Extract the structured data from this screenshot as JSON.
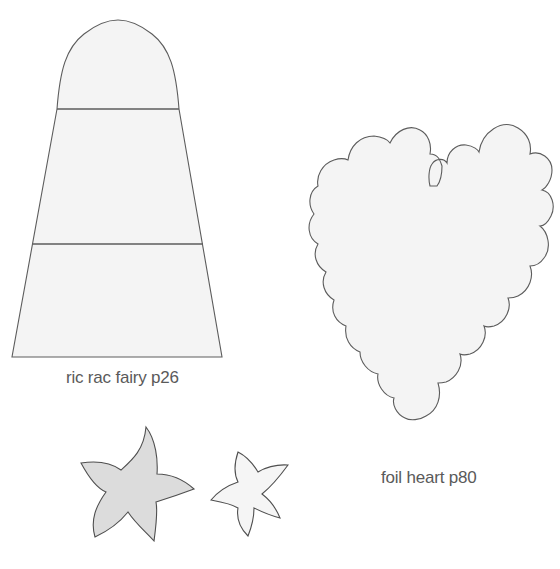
{
  "page": {
    "background": "#ffffff",
    "outline_color": "#5c5c5c",
    "fill_light": "#f4f4f4",
    "fill_shaded": "#dcdcdc"
  },
  "templates": [
    {
      "id": "ric-rac-fairy",
      "caption": "ric rac fairy p26",
      "shape": "rounded-top trapezoid body divided into 3 sections",
      "sections": 3
    },
    {
      "id": "foil-heart",
      "caption": "foil heart p80",
      "shape": "scalloped heart"
    },
    {
      "id": "flowers",
      "caption": "",
      "shape": "two five-petal flowers (large shaded, small light)",
      "count": 2
    }
  ],
  "captions": {
    "fairy": "ric rac fairy p26",
    "heart": "foil heart p80"
  }
}
